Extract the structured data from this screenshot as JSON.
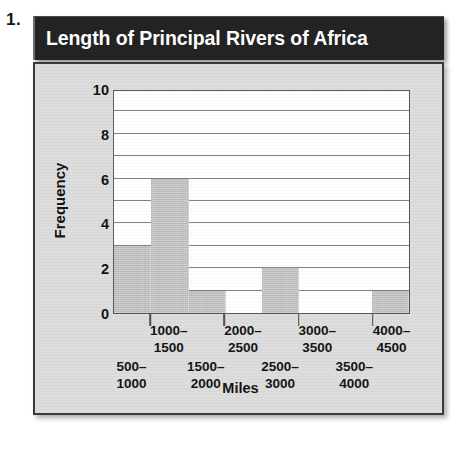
{
  "problem_number": "1.",
  "chart_data": {
    "type": "bar",
    "title": "Length of Principal Rivers of Africa",
    "xlabel": "Miles",
    "ylabel": "Frequency",
    "categories": [
      "500–\n1000",
      "1000–\n1500",
      "1500–\n2000",
      "2000–\n2500",
      "2500–\n3000",
      "3000–\n3500",
      "3500–\n4000",
      "4000–\n4500"
    ],
    "category_lines": [
      [
        "500–",
        "1000"
      ],
      [
        "1000–",
        "1500"
      ],
      [
        "1500–",
        "2000"
      ],
      [
        "2000–",
        "2500"
      ],
      [
        "2500–",
        "3000"
      ],
      [
        "3000–",
        "3500"
      ],
      [
        "3500–",
        "4000"
      ],
      [
        "4000–",
        "4500"
      ]
    ],
    "values": [
      3,
      6,
      1,
      0,
      2,
      0,
      0,
      1
    ],
    "ylim": [
      0,
      10
    ],
    "yticks": [
      0,
      2,
      4,
      6,
      8,
      10
    ],
    "ytick_labels": [
      "0",
      "2",
      "4",
      "6",
      "8",
      "10"
    ],
    "gridlines_every": 1,
    "grid": true,
    "legend": "none",
    "bar_color": "#bdbdbd",
    "plot_background": "#ffffff",
    "panel_background": "#dcdcdc",
    "title_background": "#232323",
    "title_color": "#ffffff",
    "axis_color": "#555555"
  }
}
